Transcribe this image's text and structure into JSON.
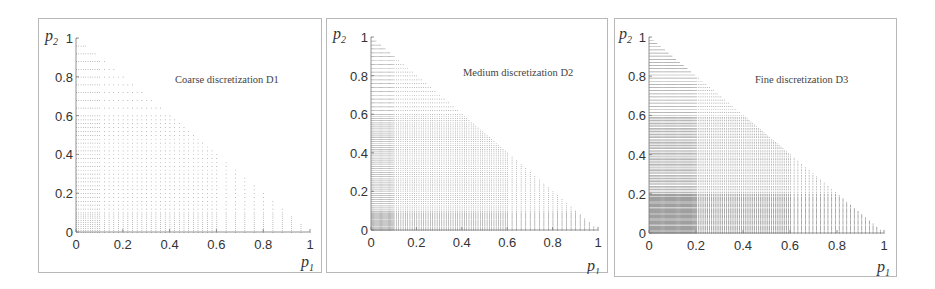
{
  "figure": {
    "background": "#ffffff",
    "border_color": "#b8b8b8",
    "point_color": "#1a1a1a"
  },
  "chart_data": [
    {
      "type": "scatter",
      "title": "Coarse discretization D1",
      "xlabel": "p1",
      "ylabel": "p2",
      "xlim": [
        0,
        1
      ],
      "ylim": [
        0,
        1
      ],
      "xticks": [
        "0",
        "0.2",
        "0.4",
        "0.6",
        "0.8",
        "1"
      ],
      "yticks": [
        "0",
        "0.2",
        "0.4",
        "0.6",
        "0.8",
        "1"
      ],
      "grid": false,
      "constraint": "p1 + p2 <= 1",
      "p1_grid": [
        {
          "from": 0.0,
          "to": 0.1,
          "step": 0.01
        },
        {
          "from": 0.1,
          "to": 0.6,
          "step": 0.02
        },
        {
          "from": 0.6,
          "to": 1.0,
          "step": 0.04
        }
      ],
      "p2_grid": [
        {
          "from": 0.0,
          "to": 0.1,
          "step": 0.01
        },
        {
          "from": 0.1,
          "to": 0.6,
          "step": 0.02
        },
        {
          "from": 0.6,
          "to": 1.0,
          "step": 0.04
        }
      ]
    },
    {
      "type": "scatter",
      "title": "Medium discretization D2",
      "xlabel": "p1",
      "ylabel": "p2",
      "xlim": [
        0,
        1
      ],
      "ylim": [
        0,
        1
      ],
      "xticks": [
        "0",
        "0.2",
        "0.4",
        "0.6",
        "0.8",
        "1"
      ],
      "yticks": [
        "0",
        "0.2",
        "0.4",
        "0.6",
        "0.8",
        "1"
      ],
      "grid": false,
      "constraint": "p1 + p2 <= 1",
      "p1_grid": [
        {
          "from": 0.0,
          "to": 0.1,
          "step": 0.005
        },
        {
          "from": 0.1,
          "to": 0.6,
          "step": 0.01
        },
        {
          "from": 0.6,
          "to": 1.0,
          "step": 0.02
        }
      ],
      "p2_grid": [
        {
          "from": 0.0,
          "to": 0.1,
          "step": 0.005
        },
        {
          "from": 0.1,
          "to": 0.6,
          "step": 0.01
        },
        {
          "from": 0.6,
          "to": 1.0,
          "step": 0.02
        }
      ]
    },
    {
      "type": "scatter",
      "title": "Fine discretization D3",
      "xlabel": "p1",
      "ylabel": "p2",
      "xlim": [
        0,
        1
      ],
      "ylim": [
        0,
        1
      ],
      "xticks": [
        "0",
        "0.2",
        "0.4",
        "0.6",
        "0.8",
        "1"
      ],
      "yticks": [
        "0",
        "0.2",
        "0.4",
        "0.6",
        "0.8",
        "1"
      ],
      "grid": false,
      "constraint": "p1 + p2 <= 1",
      "p1_grid": [
        {
          "from": 0.0,
          "to": 0.2,
          "step": 0.004
        },
        {
          "from": 0.2,
          "to": 0.6,
          "step": 0.008
        },
        {
          "from": 0.6,
          "to": 1.0,
          "step": 0.016
        }
      ],
      "p2_grid": [
        {
          "from": 0.0,
          "to": 0.2,
          "step": 0.004
        },
        {
          "from": 0.2,
          "to": 0.6,
          "step": 0.008
        },
        {
          "from": 0.6,
          "to": 1.0,
          "step": 0.016
        }
      ]
    }
  ],
  "panels": [
    {
      "title": "Coarse discretization D1",
      "ylabel_var": "p",
      "ylabel_sub": "2",
      "xlabel_var": "p",
      "xlabel_sub": "1"
    },
    {
      "title": "Medium discretization D2",
      "ylabel_var": "p",
      "ylabel_sub": "2",
      "xlabel_var": "p",
      "xlabel_sub": "1"
    },
    {
      "title": "Fine discretization D3",
      "ylabel_var": "p",
      "ylabel_sub": "2",
      "xlabel_var": "p",
      "xlabel_sub": "1"
    }
  ]
}
